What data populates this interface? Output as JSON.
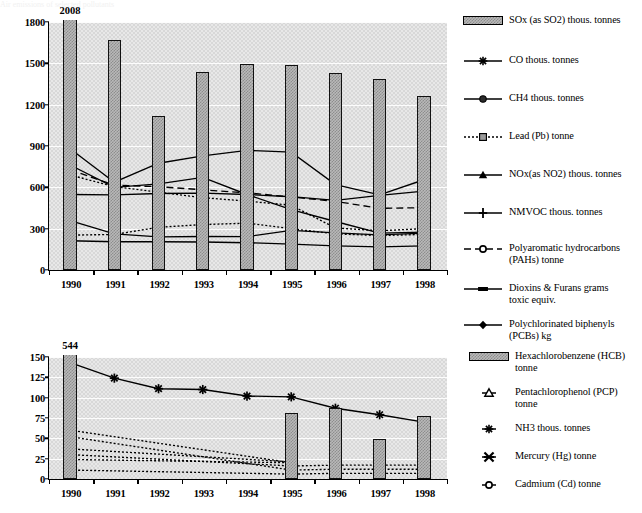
{
  "page": {
    "bleed_text": "Air emissions of selected pollutants"
  },
  "chart_data": [
    {
      "id": "top",
      "type": "bar",
      "title": "",
      "xlabel": "",
      "ylabel": "",
      "ylim": [
        0,
        1800
      ],
      "yticks": [
        0,
        300,
        600,
        900,
        1200,
        1500,
        1800
      ],
      "grid": true,
      "categories": [
        "1990",
        "1991",
        "1992",
        "1993",
        "1994",
        "1995",
        "1996",
        "1997",
        "1998"
      ],
      "annotations": [
        {
          "text": "2008",
          "category": "1990",
          "note": "value label for off-scale 1990 SOx bar"
        }
      ],
      "bar_series": {
        "name": "SOx (as SO2) thous. tonnes",
        "values": [
          2008,
          1670,
          1120,
          1435,
          1492,
          1487,
          1432,
          1385,
          1262
        ],
        "clipped_at": 1800
      },
      "series": [
        {
          "name": "CO thous. tonnes",
          "marker": "star",
          "line": "solid",
          "values": [
            880,
            637,
            775,
            828,
            868,
            855,
            620,
            545,
            655
          ]
        },
        {
          "name": "CH4 thous. tonnes",
          "marker": "circle-filled",
          "line": "solid",
          "values": [
            762,
            600,
            625,
            672,
            548,
            438,
            352,
            268,
            275
          ]
        },
        {
          "name": "Lead (Pb) tonne",
          "marker": "square-hatch",
          "line": "dotted",
          "values": [
            690,
            605,
            565,
            525,
            500,
            470,
            305,
            285,
            300
          ]
        },
        {
          "name": "NOx(as NO2) thous. tonnes",
          "marker": "triangle",
          "line": "solid",
          "values": [
            358,
            262,
            240,
            243,
            242,
            288,
            270,
            255,
            268
          ]
        },
        {
          "name": "NMVOC thous. tonnes",
          "marker": "plus",
          "line": "solid",
          "values": [
            212,
            205,
            205,
            203,
            198,
            188,
            175,
            168,
            175
          ]
        },
        {
          "name": "Polyaromatic hydrocarbons\n(PAHs) tonne",
          "marker": "circle-open",
          "line": "dashed",
          "values": [
            728,
            615,
            605,
            582,
            560,
            530,
            498,
            448,
            452
          ]
        },
        {
          "name": "Dioxins & Furans grams\ntoxic equiv.",
          "marker": "rect-filled",
          "line": "solid",
          "values": [
            548,
            545,
            555,
            558,
            548,
            532,
            505,
            542,
            572
          ]
        },
        {
          "name": "Polychlorinated biphenyls\n(PCBs) kg",
          "marker": "diamond",
          "line": "dotted",
          "values": [
            253,
            258,
            310,
            330,
            340,
            300,
            262,
            250,
            258
          ]
        }
      ]
    },
    {
      "id": "bottom",
      "type": "bar",
      "title": "",
      "xlabel": "",
      "ylabel": "",
      "ylim": [
        0,
        150
      ],
      "yticks": [
        0,
        25,
        50,
        75,
        100,
        125,
        150
      ],
      "grid": true,
      "categories": [
        "1990",
        "1991",
        "1992",
        "1993",
        "1994",
        "1995",
        "1996",
        "1997",
        "1998"
      ],
      "annotations": [
        {
          "text": "544",
          "category": "1990",
          "note": "value label for off-scale 1990 HCB bar"
        }
      ],
      "bar_series": {
        "name": "Hexachlorobenzene (HCB) tonne",
        "values": [
          544,
          null,
          null,
          null,
          null,
          81,
          87,
          49,
          78
        ],
        "clipped_at": 150
      },
      "series": [
        {
          "name": "Pentachlorophenol (PCP)\ntonne",
          "marker": "triangle-open",
          "line": "dotted",
          "values": [
            52,
            null,
            null,
            null,
            null,
            11,
            12,
            12,
            12
          ]
        },
        {
          "name": "NH3 thous. tonnes",
          "marker": "star",
          "line": "solid",
          "values": [
            143,
            124,
            111,
            110,
            102,
            101,
            87,
            79,
            70
          ]
        },
        {
          "name": "Mercury (Hg) tonne",
          "marker": "x-star",
          "line": "dotted",
          "values": [
            11,
            null,
            null,
            null,
            null,
            6,
            7,
            7,
            7
          ]
        },
        {
          "name": "Cadmium (Cd) tonne",
          "marker": "circle-open",
          "line": "dotted",
          "values": [
            30,
            null,
            null,
            null,
            null,
            16,
            17,
            17,
            17
          ]
        },
        {
          "name": "upper-dotted-trend",
          "marker": "none",
          "line": "dotted",
          "values": [
            60,
            null,
            null,
            null,
            null,
            20,
            null,
            null,
            null
          ]
        },
        {
          "name": "mid-dotted-trend",
          "marker": "none",
          "line": "dotted",
          "values": [
            37,
            null,
            null,
            null,
            null,
            21,
            null,
            null,
            null
          ]
        },
        {
          "name": "low-dotted-trend",
          "marker": "none",
          "line": "dotted",
          "values": [
            24,
            null,
            null,
            null,
            null,
            20,
            null,
            null,
            null
          ]
        }
      ]
    }
  ],
  "legend_top": {
    "items": [
      {
        "key": "swatch",
        "label": "SOx (as SO2) thous. tonnes"
      },
      {
        "key": "star",
        "label": "CO thous. tonnes"
      },
      {
        "key": "circle-filled",
        "label": "CH4 thous. tonnes"
      },
      {
        "key": "square-hatch",
        "label": "Lead (Pb) tonne"
      },
      {
        "key": "triangle",
        "label": "NOx(as NO2) thous. tonnes"
      },
      {
        "key": "plus",
        "label": "NMVOC thous. tonnes"
      },
      {
        "key": "circle-open",
        "label": "Polyaromatic hydrocarbons\n(PAHs) tonne"
      },
      {
        "key": "rect-filled",
        "label": "Dioxins & Furans grams\ntoxic equiv."
      },
      {
        "key": "diamond",
        "label": "Polychlorinated biphenyls\n(PCBs) kg"
      }
    ]
  },
  "legend_bottom": {
    "items": [
      {
        "key": "swatch",
        "label": "Hexachlorobenzene (HCB)\ntonne"
      },
      {
        "key": "triangle-open",
        "label": "Pentachlorophenol (PCP)\ntonne"
      },
      {
        "key": "star",
        "label": "NH3 thous. tonnes"
      },
      {
        "key": "x-star",
        "label": "Mercury (Hg) tonne"
      },
      {
        "key": "circle-open",
        "label": "Cadmium (Cd) tonne"
      }
    ]
  }
}
